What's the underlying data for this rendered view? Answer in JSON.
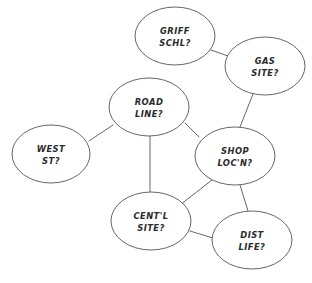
{
  "diagram": {
    "background_color": "#ffffff",
    "stroke_color": "#555555",
    "text_color": "#2b2b2b",
    "width": 312,
    "height": 283,
    "nodes": [
      {
        "id": "griff-schl",
        "line1": "GRIFF",
        "line2": "SCHL?",
        "cx": 175,
        "cy": 36,
        "rx": 40,
        "ry": 29
      },
      {
        "id": "gas-site",
        "line1": "GAS",
        "line2": "SITE?",
        "cx": 265,
        "cy": 66,
        "rx": 40,
        "ry": 29
      },
      {
        "id": "road-line",
        "line1": "ROAD",
        "line2": "LINE?",
        "cx": 149,
        "cy": 107,
        "rx": 40,
        "ry": 29
      },
      {
        "id": "west-st",
        "line1": "WEST",
        "line2": "ST?",
        "cx": 51,
        "cy": 154,
        "rx": 39,
        "ry": 29
      },
      {
        "id": "shop-locn",
        "line1": "SHOP",
        "line2": "LOC'N?",
        "cx": 235,
        "cy": 156,
        "rx": 40,
        "ry": 29
      },
      {
        "id": "centl-site",
        "line1": "CENT'L",
        "line2": "SITE?",
        "cx": 151,
        "cy": 221,
        "rx": 40,
        "ry": 29
      },
      {
        "id": "dist-life",
        "line1": "DIST",
        "line2": "LIFE?",
        "cx": 252,
        "cy": 240,
        "rx": 40,
        "ry": 29
      }
    ],
    "edges": [
      {
        "id": "griff-schl--gas-site",
        "from": "griff-schl",
        "to": "gas-site",
        "x1": 211,
        "y1": 50,
        "x2": 228,
        "y2": 56
      },
      {
        "id": "gas-site--shop-locn",
        "from": "gas-site",
        "to": "shop-locn",
        "x1": 253,
        "y1": 94,
        "x2": 240,
        "y2": 127
      },
      {
        "id": "road-line--west-st",
        "from": "road-line",
        "to": "west-st",
        "x1": 113,
        "y1": 125,
        "x2": 89,
        "y2": 141
      },
      {
        "id": "road-line--shop-locn",
        "from": "road-line",
        "to": "shop-locn",
        "x1": 185,
        "y1": 123,
        "x2": 199,
        "y2": 137
      },
      {
        "id": "road-line--centl-site",
        "from": "road-line",
        "to": "centl-site",
        "x1": 150,
        "y1": 136,
        "x2": 150,
        "y2": 192
      },
      {
        "id": "shop-locn--centl-site",
        "from": "shop-locn",
        "to": "centl-site",
        "x1": 212,
        "y1": 180,
        "x2": 180,
        "y2": 205
      },
      {
        "id": "shop-locn--dist-life",
        "from": "shop-locn",
        "to": "dist-life",
        "x1": 240,
        "y1": 185,
        "x2": 248,
        "y2": 211
      },
      {
        "id": "centl-site--dist-life",
        "from": "centl-site",
        "to": "dist-life",
        "x1": 190,
        "y1": 231,
        "x2": 213,
        "y2": 238
      }
    ]
  }
}
